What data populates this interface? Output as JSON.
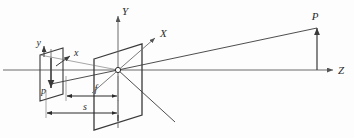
{
  "figure": {
    "background_color": "#fdfdfd",
    "line_color": "#3a3a3a",
    "axis_color": "#6b6b6b",
    "label_color": "#2b2b2b"
  },
  "labels": {
    "image_y_axis": "y",
    "image_x_axis": "x",
    "image_point": "p",
    "world_y_axis": "Y",
    "world_x_axis": "X",
    "world_z_axis": "Z",
    "world_point": "P",
    "focal_length": "f",
    "distance": "s"
  },
  "elements": {
    "image_plane_name": "image plane",
    "lens_plane_name": "lens plane",
    "origin_name": "projection center",
    "ray_name": "projection ray",
    "focal_dimension_name": "focal length dimension",
    "distance_dimension_name": "object distance dimension"
  }
}
